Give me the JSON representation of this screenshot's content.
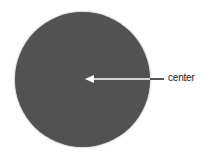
{
  "diagram": {
    "shape": "circle",
    "fill_color": "#525252",
    "label": "center",
    "arrow_color": "#ffffff",
    "leader_color": "#222222"
  }
}
